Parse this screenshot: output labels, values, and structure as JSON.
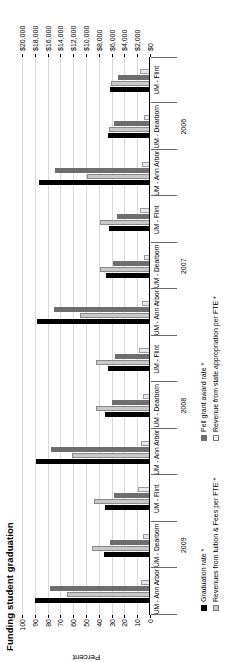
{
  "chart_data": {
    "type": "bar",
    "title": "Funding student graduation",
    "orientation": "vertical-grouped-rotated",
    "grid": true,
    "legend_position": "bottom",
    "xlabel": "",
    "ylabel": "Percent",
    "y2label": "",
    "ylim": [
      0,
      100
    ],
    "y2lim": [
      0,
      20000
    ],
    "yticks": [
      0,
      10,
      20,
      30,
      40,
      50,
      60,
      70,
      80,
      90,
      100
    ],
    "ytick_labels": [
      "0",
      "10",
      "20",
      "30",
      "40",
      "50",
      "60",
      "70",
      "80",
      "90",
      "100"
    ],
    "y2ticks": [
      0,
      2000,
      4000,
      6000,
      8000,
      10000,
      12000,
      14000,
      16000,
      18000,
      20000
    ],
    "y2tick_labels": [
      "$0",
      "$2,000",
      "$4,000",
      "$6,000",
      "$8,000",
      "$10,000",
      "$12,000",
      "$14,000",
      "$16,000",
      "$18,000",
      "$20,000"
    ],
    "categories": [
      "UM - Ann Arbor",
      "UM - Dearborn",
      "UM - Flint",
      "UM - Ann Arbor",
      "UM - Dearborn",
      "UM - Flint",
      "UM - Ann Arbor",
      "UM - Dearborn",
      "UM - Flint",
      "UM - Ann Arbor",
      "UM - Dearborn",
      "UM - Flint"
    ],
    "year_bands": [
      {
        "label": "2009",
        "start": 0,
        "span": 3
      },
      {
        "label": "2008",
        "start": 3,
        "span": 3
      },
      {
        "label": "2007",
        "start": 6,
        "span": 3
      },
      {
        "label": "2006",
        "start": 9,
        "span": 3
      }
    ],
    "series": [
      {
        "name": "Graduation rate *",
        "axis": "percent",
        "color": "#000000",
        "values": [
          90,
          36,
          35,
          89,
          35,
          33,
          88,
          34,
          32,
          87,
          33,
          31
        ]
      },
      {
        "name": "Revenues from tuition & Fees per FTE *",
        "axis": "dollars",
        "color": "#c9c9c9",
        "values": [
          13000,
          9000,
          8800,
          12200,
          8500,
          8400,
          11000,
          7800,
          7800,
          9800,
          6400,
          6100
        ]
      },
      {
        "name": "Pell grant award rate *",
        "axis": "percent",
        "color": "#6e6e6e",
        "values": [
          78,
          31,
          28,
          77,
          30,
          27,
          75,
          29,
          26,
          74,
          28,
          25
        ]
      },
      {
        "name": "Revenue from state appropriation per FTE *",
        "axis": "dollars",
        "color": "#e8e8e8",
        "values": [
          1400,
          1100,
          1800,
          1350,
          1050,
          1700,
          1300,
          1000,
          1600,
          1250,
          950,
          1500
        ]
      }
    ]
  },
  "legend": {
    "items": [
      {
        "label": "Graduation rate *",
        "swatch": "s0"
      },
      {
        "label": "Revenues from tuition & Fees per FTE *",
        "swatch": "s1"
      },
      {
        "label": "Pell grant award rate *",
        "swatch": "s2"
      },
      {
        "label": "Revenue from state appropriation per FTE *",
        "swatch": "s3"
      }
    ]
  }
}
